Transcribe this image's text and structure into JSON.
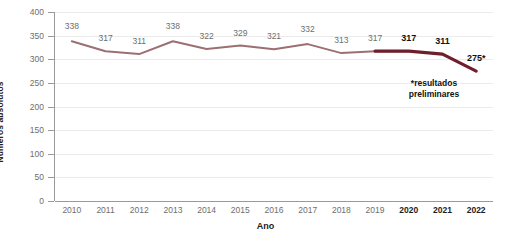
{
  "chart_data": {
    "type": "line",
    "title": "",
    "xlabel": "Ano",
    "ylabel": "Números absolutos",
    "categories": [
      "2010",
      "2011",
      "2012",
      "2013",
      "2014",
      "2015",
      "2016",
      "2017",
      "2018",
      "2019",
      "2020",
      "2021",
      "2022"
    ],
    "values": [
      338,
      317,
      311,
      338,
      322,
      329,
      321,
      332,
      313,
      317,
      317,
      311,
      275
    ],
    "point_labels": [
      "338",
      "317",
      "311",
      "338",
      "322",
      "329",
      "321",
      "332",
      "313",
      "317",
      "317",
      "311",
      "275*"
    ],
    "emphasized_categories": [
      "2020",
      "2021",
      "2022"
    ],
    "ylim": [
      0,
      400
    ],
    "ytick_labels": [
      "0",
      "50",
      "100",
      "150",
      "200",
      "250",
      "300",
      "350",
      "400"
    ],
    "ytick_values": [
      0,
      50,
      100,
      150,
      200,
      250,
      300,
      350,
      400
    ],
    "grid": true,
    "legend": "none",
    "annotation_line_1": "*resultados",
    "annotation_line_2": "preliminares",
    "series_color": "#9c6f72",
    "highlight_color": "#6e1f2a",
    "grid_color": "#ebebeb",
    "axis_color": "#9a9a9a",
    "tick_text_color": "#6e6e6e",
    "emphasis_text_color": "#111111",
    "background_color": "#ffffff"
  }
}
